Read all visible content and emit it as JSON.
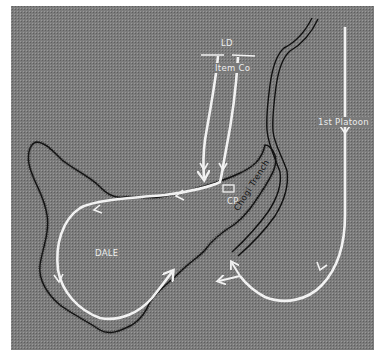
{
  "map": {
    "colors": {
      "background": "#7a7a7a",
      "terrain_line": "#111111",
      "route": "#f2f2f2",
      "label": "#ededed",
      "trench_label": "#151515"
    },
    "labels": {
      "ld": "LD",
      "item_co": "Item Co",
      "first_platoon": "1st Platoon",
      "cp": "CP",
      "dale": "DALE",
      "chogi_trench": "Chogi Trench"
    },
    "features": [
      {
        "type": "line-of-departure",
        "label": "LD"
      },
      {
        "type": "unit-route",
        "unit": "Item Co",
        "arrows": 2
      },
      {
        "type": "unit-route",
        "unit": "1st Platoon",
        "arrows": 3
      },
      {
        "type": "command-post",
        "label": "CP"
      },
      {
        "type": "hill",
        "label": "DALE"
      },
      {
        "type": "trench",
        "label": "Chogi Trench"
      }
    ]
  }
}
